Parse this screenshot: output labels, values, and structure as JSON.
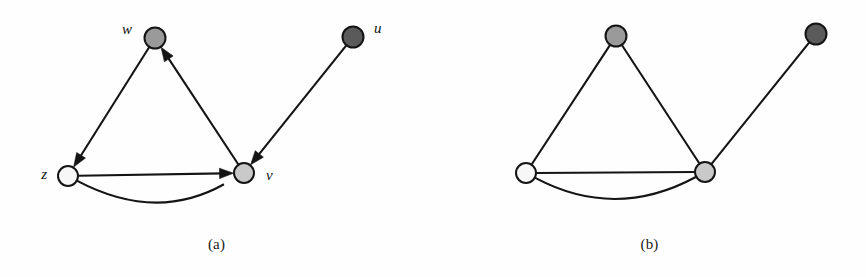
{
  "figure": {
    "width": 866,
    "height": 277,
    "background": "#fefefe",
    "stroke_color": "#141414",
    "node_stroke": "#141414"
  },
  "colors": {
    "white_node": "#f7f7f7",
    "light_gray_node": "#c9c9c9",
    "medium_gray_node": "#9a9a9a",
    "dark_gray_node": "#5a5a5a",
    "edge": "#141414"
  },
  "panels": [
    {
      "id": "a",
      "caption": "(a)",
      "type": "directed-graph",
      "nodes": [
        {
          "id": "w",
          "label": "w",
          "x": 155,
          "y": 38,
          "r": 10.5,
          "fill": "#9a9a9a",
          "label_x": 132,
          "label_y": 34,
          "label_anchor": "end"
        },
        {
          "id": "u",
          "label": "u",
          "x": 353,
          "y": 37,
          "r": 10.5,
          "fill": "#5a5a5a",
          "label_x": 374,
          "label_y": 33,
          "label_anchor": "start"
        },
        {
          "id": "z",
          "label": "z",
          "x": 68,
          "y": 176,
          "r": 10.0,
          "fill": "#f7f7f7",
          "label_x": 47,
          "label_y": 179,
          "label_anchor": "end"
        },
        {
          "id": "v",
          "label": "v",
          "x": 244,
          "y": 173,
          "r": 10.0,
          "fill": "#c9c9c9",
          "label_x": 266,
          "label_y": 180,
          "label_anchor": "start"
        }
      ],
      "edges": [
        {
          "from": "w",
          "to": "z",
          "directed": true,
          "curved": false
        },
        {
          "from": "v",
          "to": "w",
          "directed": true,
          "curved": false
        },
        {
          "from": "z",
          "to": "v",
          "directed": true,
          "curved": false
        },
        {
          "from": "u",
          "to": "v",
          "directed": true,
          "curved": false
        },
        {
          "from": "v",
          "to": "z",
          "directed": true,
          "curved": true,
          "sag": 48
        }
      ]
    },
    {
      "id": "b",
      "caption": "(b)",
      "type": "undirected-graph",
      "nodes": [
        {
          "id": "n-top",
          "label": "",
          "x": 183,
          "y": 36,
          "r": 10.5,
          "fill": "#9a9a9a"
        },
        {
          "id": "n-topright",
          "label": "",
          "x": 383,
          "y": 34,
          "r": 10.5,
          "fill": "#5a5a5a"
        },
        {
          "id": "n-left",
          "label": "",
          "x": 93,
          "y": 173,
          "r": 10.0,
          "fill": "#f7f7f7"
        },
        {
          "id": "n-right",
          "label": "",
          "x": 272,
          "y": 172,
          "r": 10.0,
          "fill": "#c9c9c9"
        }
      ],
      "edges": [
        {
          "from": "n-top",
          "to": "n-left",
          "directed": false,
          "curved": false
        },
        {
          "from": "n-top",
          "to": "n-right",
          "directed": false,
          "curved": false
        },
        {
          "from": "n-left",
          "to": "n-right",
          "directed": false,
          "curved": false
        },
        {
          "from": "n-right",
          "to": "n-topright",
          "directed": false,
          "curved": false
        },
        {
          "from": "n-left",
          "to": "n-right",
          "directed": false,
          "curved": true,
          "sag": 48
        }
      ]
    }
  ]
}
